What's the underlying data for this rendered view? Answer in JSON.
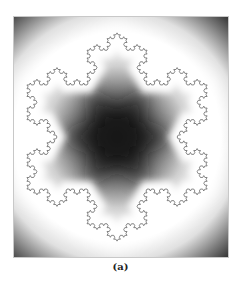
{
  "figure": {
    "caption": "(a)",
    "panel": {
      "background_far": "#000000",
      "background_near": "#ffffff",
      "curve_color": "#555555"
    },
    "snowflake": {
      "center_x": 104,
      "center_y": 121,
      "tip_radius": 105,
      "iterations": 4
    }
  }
}
